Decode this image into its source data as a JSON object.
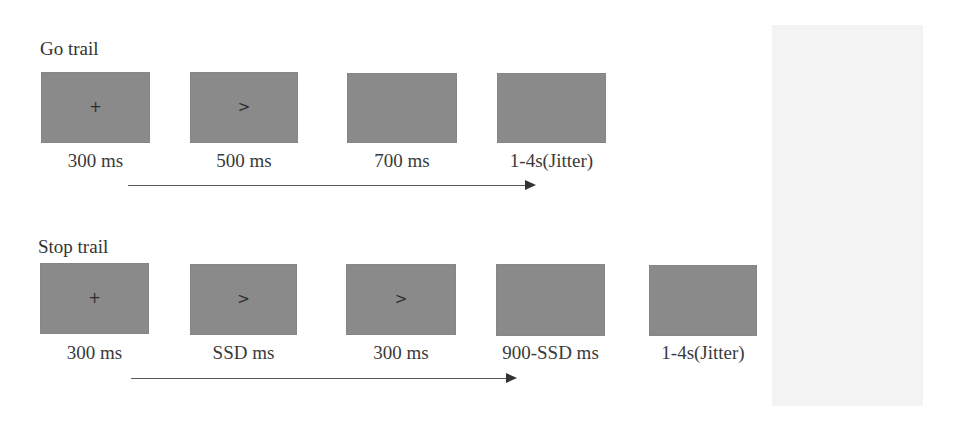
{
  "go_trial": {
    "title": "Go trail",
    "screens": [
      {
        "symbol": "+",
        "label": "300 ms"
      },
      {
        "symbol": ">",
        "label": "500 ms"
      },
      {
        "symbol": "",
        "label": "700 ms"
      },
      {
        "symbol": "",
        "label": "1-4s(Jitter)"
      }
    ]
  },
  "stop_trial": {
    "title": "Stop trail",
    "screens": [
      {
        "symbol": "+",
        "label": "300 ms"
      },
      {
        "symbol": ">",
        "label": "SSD ms"
      },
      {
        "symbol": ">",
        "label": "300 ms"
      },
      {
        "symbol": "",
        "label": "900-SSD ms"
      },
      {
        "symbol": "",
        "label": "1-4s(Jitter)"
      }
    ]
  },
  "colors": {
    "screen_fill": "#8a8a8a",
    "arrow": "#5a5a5a",
    "side_panel": "#f3f3f3"
  }
}
